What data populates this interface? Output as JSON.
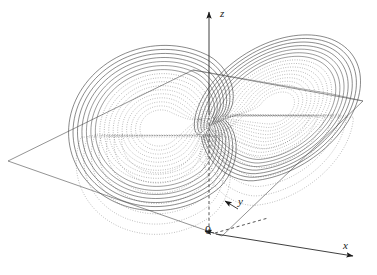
{
  "figure": {
    "title": "",
    "caption": "",
    "background_color": "#ffffff",
    "stroke_color": "#3a3a3a",
    "width": 377,
    "height": 275
  },
  "axes": {
    "z": {
      "label": "z",
      "arrow": "up",
      "tip": [
        209,
        8
      ],
      "base": [
        209,
        118
      ]
    },
    "y": {
      "label": "y",
      "arrow": "up-left",
      "tip": [
        222,
        201
      ],
      "base": [
        247,
        213
      ]
    },
    "x": {
      "label": "x",
      "arrow": "down-right",
      "tip": [
        358,
        258
      ],
      "base": [
        222,
        236
      ]
    },
    "origin": {
      "label": "0",
      "position": [
        211,
        232
      ]
    }
  },
  "plane": {
    "name": "horizontal-reference-plane",
    "corners": [
      [
        8,
        161
      ],
      [
        193,
        70
      ],
      [
        363,
        101
      ],
      [
        222,
        236
      ]
    ],
    "stroke": "#555555"
  },
  "chart_data": {
    "type": "line",
    "xlabel": "x",
    "ylabel": "y",
    "zlabel": "z",
    "projection": "3d-oblique",
    "grid": false,
    "legend": null,
    "annotations": [
      "0",
      "x",
      "y",
      "z"
    ],
    "system": {
      "name": "Lorenz system",
      "equations": [
        "dx/dt = sigma*(y - x)",
        "dy/dt = x*(rho - z) - y",
        "dz/dt = x*y - beta*z"
      ],
      "sigma": 10,
      "rho": 28,
      "beta": 2.6667
    },
    "lobes": [
      {
        "name": "left-lobe",
        "center_px": [
          160,
          128
        ],
        "radius_x_px": 92,
        "radius_y_px": 82,
        "rotation_deg": -14,
        "turn_count": 17,
        "style": "solid-outer-dotted-inner"
      },
      {
        "name": "right-lobe",
        "center_px": [
          276,
          108
        ],
        "radius_x_px": 93,
        "radius_y_px": 62,
        "rotation_deg": -34,
        "turn_count": 17,
        "style": "solid-upper-dotted-lower"
      }
    ],
    "saddle": {
      "position_px": [
        204,
        118
      ],
      "label": "crossing region"
    },
    "series": [
      {
        "name": "trajectory-left-wing",
        "points_count": 17,
        "style": "spiral-outward"
      },
      {
        "name": "trajectory-right-wing",
        "points_count": 17,
        "style": "spiral-outward"
      }
    ]
  }
}
